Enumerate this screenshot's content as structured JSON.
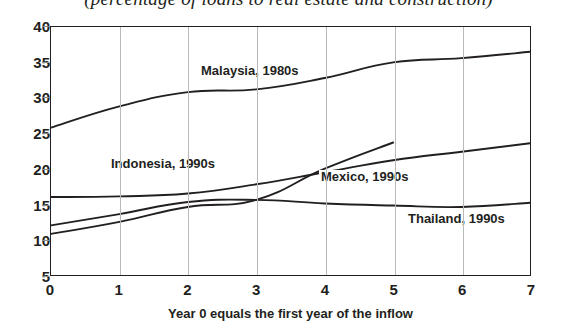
{
  "chart": {
    "title": "(percentage of loans to real estate and construction)",
    "xlabel": "Year 0 equals the first year of the inflow"
  },
  "axes": {
    "y_ticks": [
      "40",
      "35",
      "30",
      "25",
      "20",
      "15",
      "10",
      "5"
    ],
    "x_ticks": [
      "0",
      "1",
      "2",
      "3",
      "4",
      "5",
      "6",
      "7"
    ]
  },
  "labels": {
    "malaysia": "Malaysia, 1980s",
    "indonesia": "Indonesia, 1990s",
    "mexico": "Mexico, 1990s",
    "thailand": "Thailand, 1990s"
  },
  "colors": {
    "line": "#231f20",
    "grid": "#b9b9b9",
    "axis": "#231f20",
    "background": "#ffffff"
  },
  "chart_data": {
    "type": "line",
    "title": "(percentage of loans to real estate and construction)",
    "xlabel": "Year 0 equals the first year of the inflow",
    "ylabel": "",
    "xlim": [
      0,
      7
    ],
    "ylim": [
      5,
      40
    ],
    "grid": "vertical",
    "legend": "inline-annotations",
    "x": [
      0,
      1,
      2,
      3,
      4,
      5,
      6,
      7
    ],
    "series": [
      {
        "name": "Malaysia, 1980s",
        "x": [
          0,
          1,
          2,
          3,
          4,
          5,
          6,
          7
        ],
        "values": [
          25.8,
          28.8,
          30.8,
          31.2,
          32.8,
          35.0,
          35.6,
          36.5
        ]
      },
      {
        "name": "Indonesia, 1990s",
        "x": [
          0,
          1,
          2,
          3,
          4,
          5,
          6,
          7
        ],
        "values": [
          16.0,
          16.1,
          16.5,
          17.8,
          19.5,
          21.2,
          22.4,
          23.6
        ]
      },
      {
        "name": "Mexico, 1990s",
        "x": [
          0,
          1,
          2,
          3,
          4,
          5
        ],
        "values": [
          10.8,
          12.5,
          14.6,
          15.6,
          20.0,
          23.7
        ]
      },
      {
        "name": "Thailand, 1990s",
        "x": [
          0,
          1,
          2,
          3,
          4,
          5,
          6,
          7
        ],
        "values": [
          12.0,
          13.6,
          15.3,
          15.6,
          15.1,
          14.8,
          14.6,
          15.2
        ]
      }
    ]
  }
}
